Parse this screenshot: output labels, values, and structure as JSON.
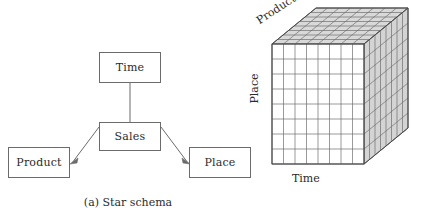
{
  "figure": {
    "width": 433,
    "height": 221,
    "background": "#ffffff",
    "line_color": "#6b6b6b",
    "text_color": "#2b2b2b"
  },
  "panel_a": {
    "caption": "(a) Star schema",
    "fact_table": {
      "label": "Sales"
    },
    "dimensions": [
      {
        "label": "Time"
      },
      {
        "label": "Product"
      },
      {
        "label": "Place"
      }
    ],
    "edges": [
      {
        "from": "Sales",
        "to": "Time"
      },
      {
        "from": "Sales",
        "to": "Product"
      },
      {
        "from": "Sales",
        "to": "Place"
      }
    ]
  },
  "panel_b": {
    "caption": "(b) Cube metaphor",
    "axes": {
      "x": "Time",
      "y": "Place",
      "z": "Product"
    },
    "grid": {
      "columns": 8,
      "rows": 8,
      "depth": 8
    },
    "face_fill": "#ffffff",
    "shade_fill": "#d8d8d8"
  }
}
